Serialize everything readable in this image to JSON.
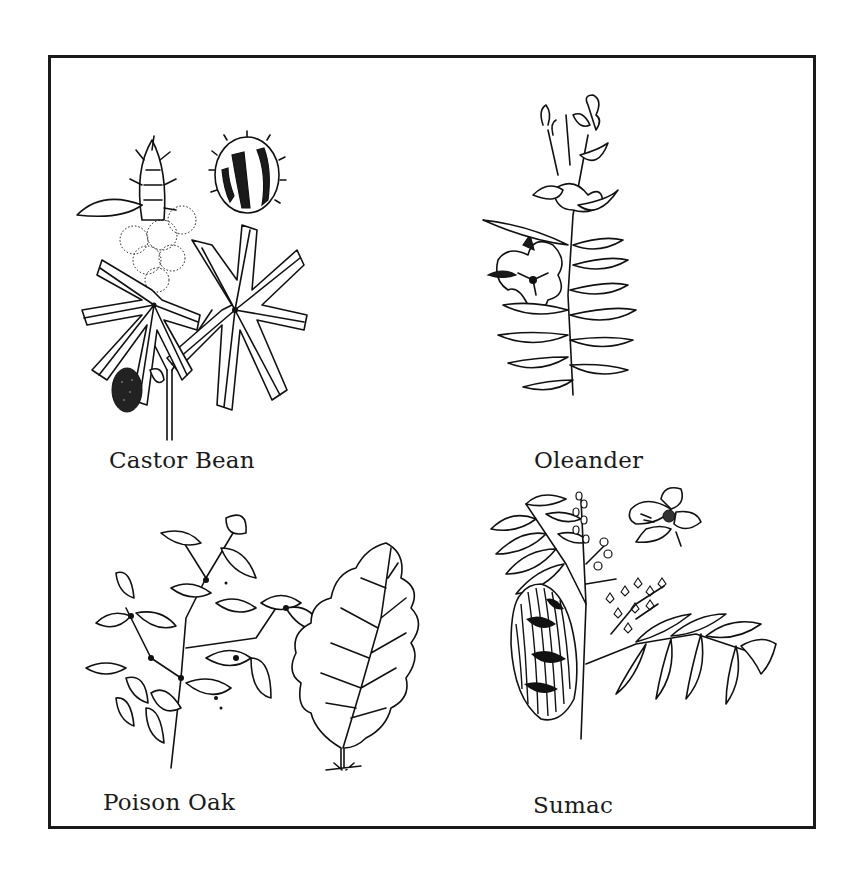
{
  "figure": {
    "panels": [
      {
        "id": "castor-bean",
        "label": "Castor Bean"
      },
      {
        "id": "oleander",
        "label": "Oleander"
      },
      {
        "id": "poison-oak",
        "label": "Poison Oak"
      },
      {
        "id": "sumac",
        "label": "Sumac"
      }
    ]
  },
  "colors": {
    "ink": "#1a1a1a",
    "background": "#ffffff"
  }
}
